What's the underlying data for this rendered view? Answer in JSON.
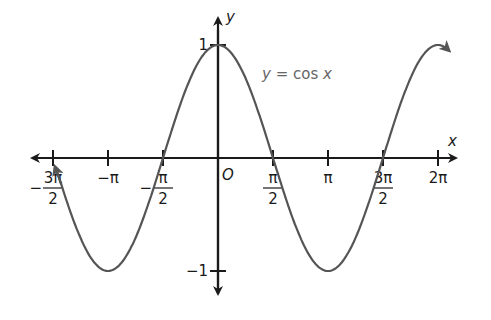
{
  "chart_data": {
    "type": "line",
    "title": "",
    "function": "y = cos x",
    "annotation": "y = cos x",
    "xlabel": "x",
    "ylabel": "y",
    "origin_label": "O",
    "xlim": [
      -4.712,
      6.283
    ],
    "ylim": [
      -1,
      1
    ],
    "grid": false,
    "x_ticks": [
      {
        "value": -4.712,
        "label": "-3π/2",
        "num": "3π",
        "den": "2",
        "sign": "−"
      },
      {
        "value": -3.1416,
        "label": "−π"
      },
      {
        "value": -1.5708,
        "label": "-π/2",
        "num": "π",
        "den": "2",
        "sign": "−"
      },
      {
        "value": 1.5708,
        "label": "π/2",
        "num": "π",
        "den": "2"
      },
      {
        "value": 3.1416,
        "label": "π"
      },
      {
        "value": 4.712,
        "label": "3π/2",
        "num": "3π",
        "den": "2"
      },
      {
        "value": 6.283,
        "label": "2π"
      }
    ],
    "y_ticks": [
      {
        "value": 1,
        "label": "1"
      },
      {
        "value": -1,
        "label": "−1"
      }
    ],
    "series": [
      {
        "name": "y = cos x",
        "x_start": -4.6,
        "x_end": 6.6,
        "color": "#555555"
      }
    ]
  }
}
